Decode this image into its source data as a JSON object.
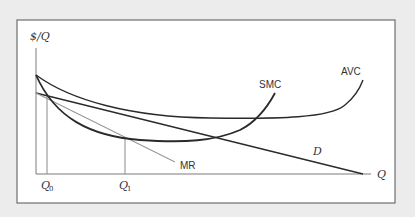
{
  "diagram": {
    "axes": {
      "y_label": "$/Q",
      "x_label": "Q"
    },
    "x_ticks": [
      {
        "label_main": "Q",
        "label_sub": "0"
      },
      {
        "label_main": "Q",
        "label_sub": "1"
      }
    ],
    "curves": [
      {
        "id": "smc",
        "label": "SMC",
        "color": "#2a2a2a"
      },
      {
        "id": "avc",
        "label": "AVC",
        "color": "#2a2a2a"
      },
      {
        "id": "mr",
        "label": "MR",
        "color": "#9a9a9a"
      },
      {
        "id": "d",
        "label": "D",
        "color": "#2a2a2a"
      }
    ],
    "colors": {
      "background": "#ececec",
      "panel": "#ffffff",
      "frame": "#6e6e6e",
      "axis": "#7a7a7a",
      "guide": "#8a8a8a"
    }
  }
}
